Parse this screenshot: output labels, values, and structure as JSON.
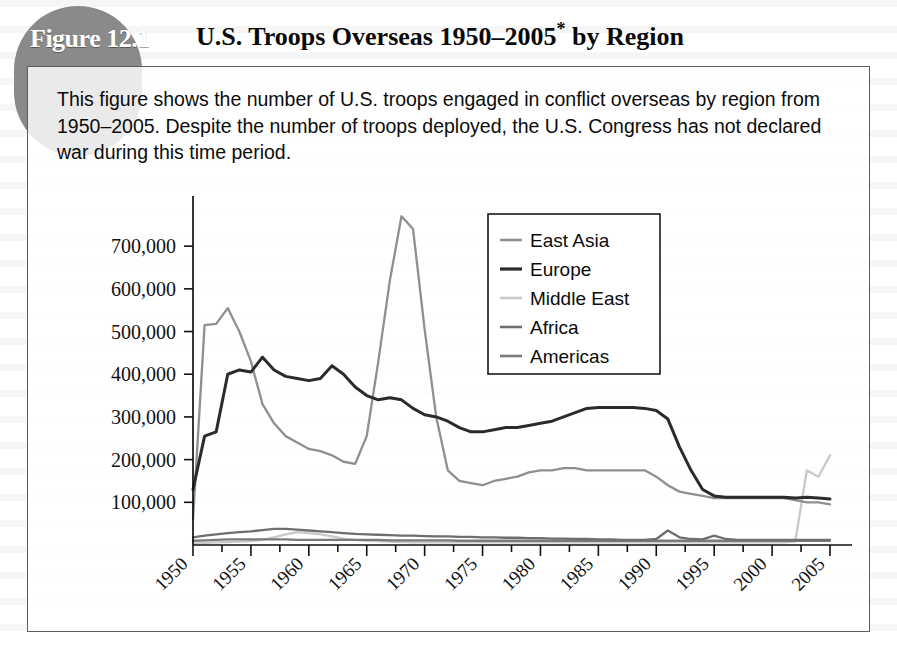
{
  "figure": {
    "tag": "Figure 12.1",
    "title_main": "U.S. Troops Overseas 1950–2005",
    "title_asterisk": "*",
    "title_tail": " by Region",
    "description": "This figure shows the number of U.S. troops engaged in conflict overseas by region from 1950–2005. Despite the number of troops deployed, the U.S. Congress has not declared war during this time period.",
    "tag_bg_color": "#8a8a8a",
    "border_color": "#5d5d5d"
  },
  "chart_data": {
    "type": "line",
    "title": "U.S. Troops Overseas 1950–2005* by Region",
    "xlabel": "",
    "ylabel": "",
    "grid": false,
    "legend_position": "top-right",
    "xlim": [
      1950,
      2005
    ],
    "ylim": [
      0,
      780000
    ],
    "ytick_labels": [
      "100,000",
      "200,000",
      "300,000",
      "400,000",
      "500,000",
      "600,000",
      "700,000"
    ],
    "ytick_values": [
      100000,
      200000,
      300000,
      400000,
      500000,
      600000,
      700000
    ],
    "xtick_labels": [
      "1950",
      "1955",
      "1960",
      "1965",
      "1970",
      "1975",
      "1980",
      "1985",
      "1990",
      "1995",
      "2000",
      "2005"
    ],
    "xtick_values": [
      1950,
      1955,
      1960,
      1965,
      1970,
      1975,
      1980,
      1985,
      1990,
      1995,
      2000,
      2005
    ],
    "x": [
      1950,
      1951,
      1952,
      1953,
      1954,
      1955,
      1956,
      1957,
      1958,
      1959,
      1960,
      1961,
      1962,
      1963,
      1964,
      1965,
      1966,
      1967,
      1968,
      1969,
      1970,
      1971,
      1972,
      1973,
      1974,
      1975,
      1976,
      1977,
      1978,
      1979,
      1980,
      1981,
      1982,
      1983,
      1984,
      1985,
      1986,
      1987,
      1988,
      1989,
      1990,
      1991,
      1992,
      1993,
      1994,
      1995,
      1996,
      1997,
      1998,
      1999,
      2000,
      2001,
      2002,
      2003,
      2004,
      2005
    ],
    "series": [
      {
        "name": "East Asia",
        "color": "#8f8f8f",
        "values": [
          60000,
          515000,
          518000,
          555000,
          500000,
          430000,
          330000,
          285000,
          255000,
          240000,
          225000,
          220000,
          210000,
          195000,
          190000,
          255000,
          430000,
          620000,
          770000,
          740000,
          505000,
          300000,
          175000,
          150000,
          145000,
          140000,
          150000,
          155000,
          160000,
          170000,
          175000,
          175000,
          180000,
          180000,
          175000,
          175000,
          175000,
          175000,
          175000,
          175000,
          160000,
          140000,
          125000,
          120000,
          115000,
          110000,
          110000,
          110000,
          110000,
          110000,
          110000,
          110000,
          105000,
          100000,
          100000,
          95000
        ]
      },
      {
        "name": "Europe",
        "color": "#2b2b2b",
        "values": [
          130000,
          255000,
          265000,
          400000,
          410000,
          405000,
          440000,
          410000,
          395000,
          390000,
          385000,
          390000,
          420000,
          400000,
          370000,
          350000,
          340000,
          345000,
          340000,
          320000,
          305000,
          300000,
          290000,
          275000,
          265000,
          265000,
          270000,
          275000,
          275000,
          280000,
          285000,
          290000,
          300000,
          310000,
          320000,
          322000,
          322000,
          322000,
          322000,
          320000,
          315000,
          295000,
          230000,
          175000,
          130000,
          115000,
          112000,
          112000,
          112000,
          112000,
          112000,
          112000,
          110000,
          112000,
          110000,
          108000
        ]
      },
      {
        "name": "Middle East",
        "color": "#c9c9c9",
        "values": [
          3000,
          5000,
          6000,
          7000,
          8000,
          9000,
          12000,
          18000,
          25000,
          30000,
          28000,
          25000,
          20000,
          15000,
          12000,
          10000,
          9000,
          8000,
          7000,
          6000,
          6000,
          6000,
          6000,
          6000,
          6000,
          6000,
          6000,
          6000,
          6000,
          6000,
          6000,
          6000,
          6000,
          6000,
          6000,
          6000,
          6000,
          6000,
          6000,
          6000,
          6000,
          6000,
          6000,
          6000,
          6000,
          6000,
          6000,
          6000,
          6000,
          6000,
          6000,
          6000,
          8000,
          175000,
          160000,
          210000
        ]
      },
      {
        "name": "Africa",
        "color": "#6e6e6e",
        "values": [
          18000,
          22000,
          25000,
          28000,
          30000,
          32000,
          35000,
          38000,
          38000,
          36000,
          34000,
          32000,
          30000,
          28000,
          26000,
          25000,
          24000,
          23000,
          22000,
          22000,
          21000,
          20000,
          20000,
          19000,
          19000,
          18000,
          18000,
          17000,
          17000,
          16000,
          16000,
          15000,
          15000,
          14000,
          14000,
          13000,
          13000,
          12000,
          12000,
          12000,
          14000,
          34000,
          18000,
          14000,
          13000,
          22000,
          14000,
          12000,
          12000,
          12000,
          12000,
          12000,
          12000,
          12000,
          12000,
          12000
        ]
      },
      {
        "name": "Americas",
        "color": "#7a7a7a",
        "values": [
          10000,
          11000,
          12000,
          13000,
          13000,
          13000,
          13000,
          13000,
          13000,
          12000,
          12000,
          12000,
          12000,
          12000,
          12000,
          12000,
          12000,
          11000,
          11000,
          11000,
          11000,
          11000,
          11000,
          10000,
          10000,
          10000,
          10000,
          10000,
          10000,
          10000,
          10000,
          10000,
          10000,
          10000,
          10000,
          10000,
          10000,
          10000,
          10000,
          10000,
          10000,
          10000,
          10000,
          10000,
          10000,
          10000,
          10000,
          10000,
          10000,
          10000,
          10000,
          10000,
          10000,
          10000,
          10000,
          10000
        ]
      }
    ],
    "legend_entries": [
      {
        "label": "East Asia",
        "color": "#8f8f8f"
      },
      {
        "label": "Europe",
        "color": "#2b2b2b"
      },
      {
        "label": "Middle East",
        "color": "#c9c9c9"
      },
      {
        "label": "Africa",
        "color": "#6e6e6e"
      },
      {
        "label": "Americas",
        "color": "#7a7a7a"
      }
    ]
  }
}
